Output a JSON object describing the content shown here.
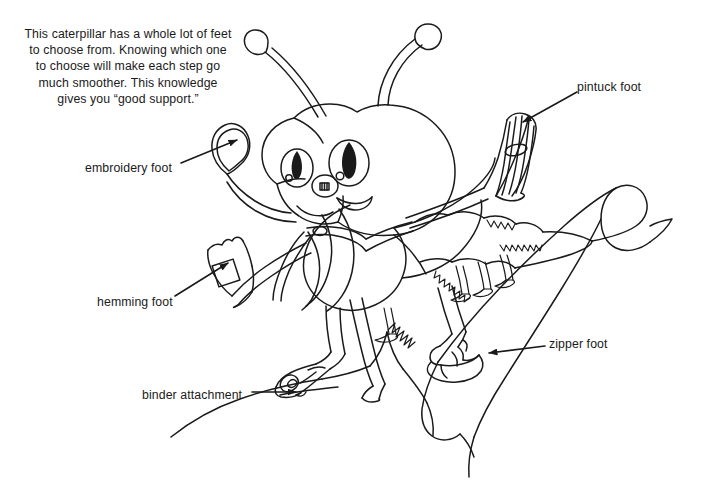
{
  "illustration": {
    "title": "Sewing machine presser feet caterpillar diagram",
    "style": "black-and-white line drawing",
    "background_color": "#ffffff",
    "line_color": "#1a1a1a",
    "subject": "caterpillar",
    "caption": "This caterpillar has a whole lot of feet to choose from. Knowing which one to choose will make each step go much smoother. This knowledge gives you “good support.”",
    "caption_lines": [
      "This caterpillar has a whole lot of feet",
      "to choose from. Knowing which one",
      "to choose will make each step go",
      "much smoother. This knowledge",
      "gives you “good support.”"
    ]
  },
  "callouts": [
    {
      "id": "embroidery",
      "label": "embroidery foot",
      "arrow_direction": "up-right"
    },
    {
      "id": "hemming",
      "label": "hemming foot",
      "arrow_direction": "up-right"
    },
    {
      "id": "binder",
      "label": "binder attachment",
      "arrow_direction": "right"
    },
    {
      "id": "zipper",
      "label": "zipper foot",
      "arrow_direction": "left"
    },
    {
      "id": "pintuck",
      "label": "pintuck foot",
      "arrow_direction": "down-left"
    }
  ]
}
